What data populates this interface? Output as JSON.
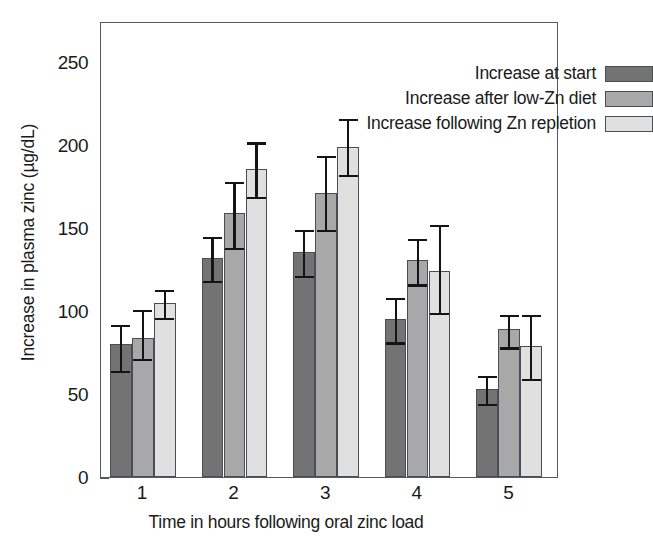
{
  "chart_data": {
    "type": "bar",
    "title": "",
    "xlabel": "Time in hours following oral zinc load",
    "ylabel": "Increase in plasma zinc (µg/dL)",
    "categories": [
      "1",
      "2",
      "3",
      "4",
      "5"
    ],
    "ylim": [
      0,
      275
    ],
    "yticks": [
      0,
      50,
      100,
      150,
      200,
      250
    ],
    "ytick_labels": [
      "0",
      "50",
      "100",
      "150",
      "200",
      "250"
    ],
    "grid": false,
    "legend_position": "top-right",
    "series": [
      {
        "name": "Increase at start",
        "color": "#737373",
        "values": [
          80,
          132,
          136,
          95,
          53
        ],
        "err_low": [
          16,
          14,
          15,
          14,
          9
        ],
        "err_high": [
          13,
          14,
          14,
          14,
          9
        ]
      },
      {
        "name": "Increase after low-Zn diet",
        "color": "#a8a8a8",
        "values": [
          84,
          159,
          171,
          131,
          89
        ],
        "err_low": [
          13,
          21,
          22,
          15,
          11
        ],
        "err_high": [
          18,
          20,
          24,
          14,
          10
        ]
      },
      {
        "name": "Increase following Zn repletion",
        "color": "#e0e0e0",
        "values": [
          105,
          186,
          199,
          124,
          79
        ],
        "err_low": [
          9,
          17,
          17,
          25,
          20
        ],
        "err_high": [
          9,
          17,
          18,
          29,
          20
        ]
      }
    ]
  },
  "axes": {
    "x_tick_labels": [
      "1",
      "2",
      "3",
      "4",
      "5"
    ],
    "y_tick_labels": [
      "0",
      "50",
      "100",
      "150",
      "200",
      "250"
    ]
  }
}
